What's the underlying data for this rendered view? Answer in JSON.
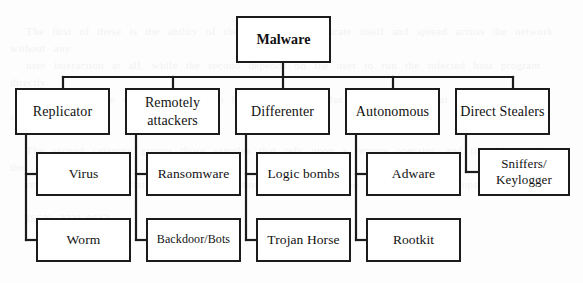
{
  "diagram": {
    "background_color": "#fdfdfd",
    "line_color": "#1b1b1b",
    "box_fill": "#ffffff",
    "ghost_text": "                                                                                                                        \n  The first of these is the ability of the malware to replicate itself and spread across the network without any\n  user interaction at all, while the second depends on the user to run the infected host program directly.\n  In this work the classification shown below is adopted for the discussion that follows in later sections.\n\n  The second category groups those samples that rely upon a remote operator, and the third collects the\n  remaining families that differ in propagation strategy from the two preceding groups.\n\n  ISSN 2321-0613",
    "root": {
      "id": "malware",
      "label": "Malware",
      "x": 236,
      "y": 16,
      "w": 95,
      "h": 47
    },
    "bus": {
      "y": 77,
      "x_start": 63,
      "x_end": 513,
      "root_stem_x": 283
    },
    "categories": [
      {
        "id": "replicator",
        "label": "Replicator",
        "lines": [
          "Replicator"
        ],
        "x": 15,
        "y": 88,
        "w": 95,
        "h": 47,
        "stem_x": 63,
        "trunk_x": 26,
        "children": [
          "virus",
          "worm"
        ]
      },
      {
        "id": "remotely-attackers",
        "label": "Remotely attackers",
        "lines": [
          "Remotely",
          "attackers"
        ],
        "x": 125,
        "y": 88,
        "w": 95,
        "h": 47,
        "stem_x": 173,
        "trunk_x": 136,
        "children": [
          "ransomware",
          "backdoor-bots"
        ]
      },
      {
        "id": "differenter",
        "label": "Differenter",
        "lines": [
          "Differenter"
        ],
        "x": 235,
        "y": 88,
        "w": 95,
        "h": 47,
        "stem_x": 283,
        "trunk_x": 246,
        "children": [
          "logic-bombs",
          "trojan-horse"
        ]
      },
      {
        "id": "autonomous",
        "label": "Autonomous",
        "lines": [
          "Autonomous"
        ],
        "x": 345,
        "y": 88,
        "w": 95,
        "h": 47,
        "stem_x": 393,
        "trunk_x": 356,
        "children": [
          "adware",
          "rootkit"
        ]
      },
      {
        "id": "direct-stealers",
        "label": "Direct Stealers",
        "lines": [
          "Direct Stealers"
        ],
        "x": 455,
        "y": 88,
        "w": 95,
        "h": 47,
        "stem_x": 513,
        "trunk_x": 466,
        "children": [
          "sniffers-keylogger"
        ]
      }
    ],
    "leaves": [
      {
        "id": "virus",
        "label": "Virus",
        "lines": [
          "Virus"
        ],
        "x": 36,
        "y": 152,
        "w": 95,
        "h": 44,
        "size": "normal"
      },
      {
        "id": "worm",
        "label": "Worm",
        "lines": [
          "Worm"
        ],
        "x": 36,
        "y": 218,
        "w": 95,
        "h": 44,
        "size": "normal"
      },
      {
        "id": "ransomware",
        "label": "Ransomware",
        "lines": [
          "Ransomware"
        ],
        "x": 146,
        "y": 152,
        "w": 95,
        "h": 44,
        "size": "normal"
      },
      {
        "id": "backdoor-bots",
        "label": "Backdoor/Bots",
        "lines": [
          "Backdoor/Bots"
        ],
        "x": 146,
        "y": 218,
        "w": 95,
        "h": 44,
        "size": "small"
      },
      {
        "id": "logic-bombs",
        "label": "Logic bombs",
        "lines": [
          "Logic bombs"
        ],
        "x": 256,
        "y": 152,
        "w": 95,
        "h": 44,
        "size": "normal"
      },
      {
        "id": "trojan-horse",
        "label": "Trojan Horse",
        "lines": [
          "Trojan Horse"
        ],
        "x": 256,
        "y": 218,
        "w": 95,
        "h": 44,
        "size": "normal"
      },
      {
        "id": "adware",
        "label": "Adware",
        "lines": [
          "Adware"
        ],
        "x": 366,
        "y": 152,
        "w": 95,
        "h": 44,
        "size": "normal"
      },
      {
        "id": "rootkit",
        "label": "Rootkit",
        "lines": [
          "Rootkit"
        ],
        "x": 366,
        "y": 218,
        "w": 95,
        "h": 44,
        "size": "normal"
      },
      {
        "id": "sniffers-keylogger",
        "label": "Sniffers/ Keylogger",
        "lines": [
          "Sniffers/",
          "Keylogger"
        ],
        "x": 478,
        "y": 148,
        "w": 92,
        "h": 48,
        "size": "two-line"
      }
    ]
  }
}
